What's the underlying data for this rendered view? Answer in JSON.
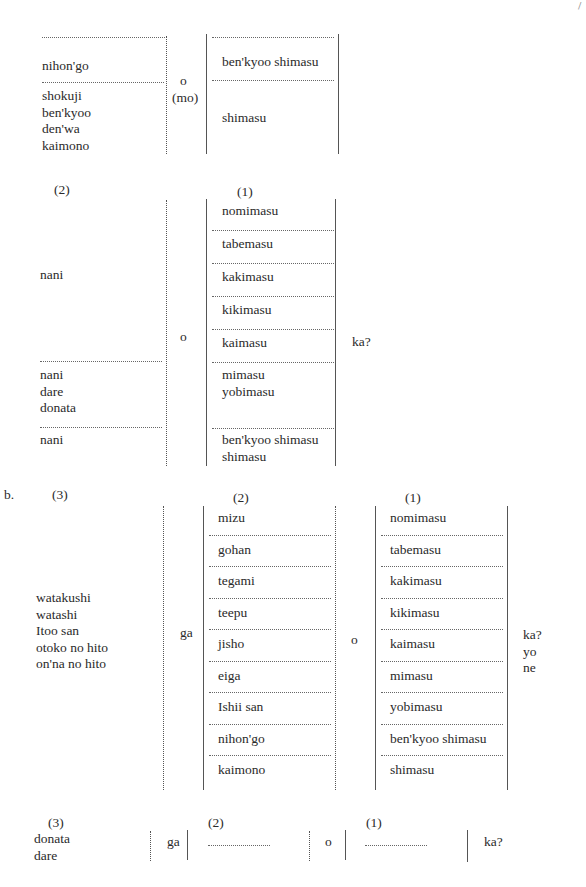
{
  "page_mark": "/",
  "section_a1": {
    "left_items": [
      "nihon'go"
    ],
    "left_group2": [
      "shokuji",
      "ben'kyoo",
      "den'wa",
      "kaimono"
    ],
    "particle": "o",
    "particle_alt": "(mo)",
    "right_items": [
      "ben'kyoo shimasu",
      "shimasu"
    ]
  },
  "section_a2": {
    "label_left": "(2)",
    "label_right": "(1)",
    "left_items": [
      "nani",
      "nani\ndare\ndonata",
      "nani"
    ],
    "particle": "o",
    "verbs": [
      "nomimasu",
      "tabemasu",
      "kakimasu",
      "kikimasu",
      "kaimasu",
      "mimasu\nyobimasu",
      "ben'kyoo shimasu\nshimasu"
    ],
    "ending": "ka?"
  },
  "section_b": {
    "marker": "b.",
    "label_subject": "(3)",
    "label_object": "(2)",
    "label_verb": "(1)",
    "subjects": "watakushi\nwatashi\nItoo san\notoko no hito\non'na no hito",
    "subject_particle": "ga",
    "objects": [
      "mizu",
      "gohan",
      "tegami",
      "teepu",
      "jisho",
      "eiga",
      "Ishii san",
      "nihon'go",
      "kaimono"
    ],
    "object_particle": "o",
    "verbs": [
      "nomimasu",
      "tabemasu",
      "kakimasu",
      "kikimasu",
      "kaimasu",
      "mimasu",
      "yobimasu",
      "ben'kyoo shimasu",
      "shimasu"
    ],
    "endings": "ka?\nyo\nne"
  },
  "section_b_question": {
    "label_subject": "(3)",
    "subjects": "donata\ndare",
    "subject_particle": "ga",
    "label_object": "(2)",
    "object_placeholder": "..........",
    "object_particle": "o",
    "label_verb": "(1)",
    "verb_placeholder": "..........",
    "ending": "ka?"
  }
}
